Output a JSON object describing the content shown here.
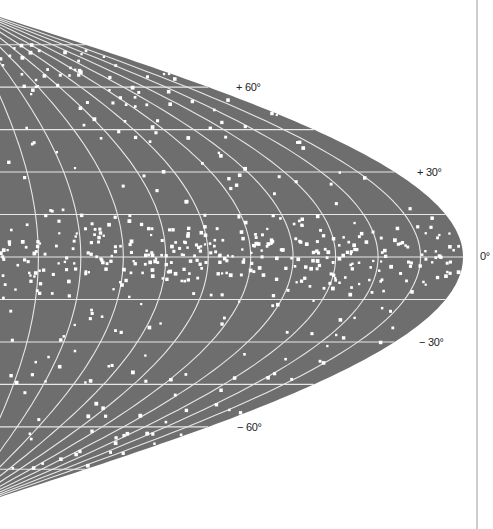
{
  "map": {
    "projection": "sinusoidal",
    "coordinate_system": "galactic",
    "colors": {
      "background": "#ffffff",
      "map_fill": "#6e6e6e",
      "grid": "#e8e8e8",
      "stars": "#ffffff",
      "border_line": "#9a9a9a",
      "label": "#222222"
    },
    "grid": {
      "parallel_step_deg": 15,
      "meridian_step_deg": 15
    },
    "latitude_labels": [
      {
        "text": "+ 60°",
        "lat": 60
      },
      {
        "text": "+ 30°",
        "lat": 30
      },
      {
        "text": "0°",
        "lat": 0
      },
      {
        "text": "− 30°",
        "lat": -30
      },
      {
        "text": "− 60°",
        "lat": -60
      }
    ]
  }
}
